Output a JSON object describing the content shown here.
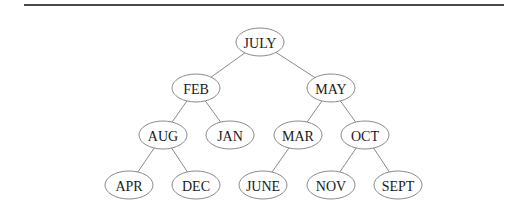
{
  "diagram": {
    "type": "binary-search-tree",
    "nodes": [
      {
        "id": "JULY",
        "label": "JULY",
        "cx": 260,
        "cy": 42
      },
      {
        "id": "FEB",
        "label": "FEB",
        "cx": 196,
        "cy": 88
      },
      {
        "id": "MAY",
        "label": "MAY",
        "cx": 331,
        "cy": 88
      },
      {
        "id": "AUG",
        "label": "AUG",
        "cx": 163,
        "cy": 135
      },
      {
        "id": "JAN",
        "label": "JAN",
        "cx": 230,
        "cy": 135
      },
      {
        "id": "MAR",
        "label": "MAR",
        "cx": 298,
        "cy": 135
      },
      {
        "id": "OCT",
        "label": "OCT",
        "cx": 365,
        "cy": 135
      },
      {
        "id": "APR",
        "label": "APR",
        "cx": 129,
        "cy": 185
      },
      {
        "id": "DEC",
        "label": "DEC",
        "cx": 196,
        "cy": 185
      },
      {
        "id": "JUNE",
        "label": "JUNE",
        "cx": 263,
        "cy": 185
      },
      {
        "id": "NOV",
        "label": "NOV",
        "cx": 331,
        "cy": 185
      },
      {
        "id": "SEPT",
        "label": "SEPT",
        "cx": 398,
        "cy": 185
      }
    ],
    "edges": [
      {
        "from": "JULY",
        "to": "FEB"
      },
      {
        "from": "JULY",
        "to": "MAY"
      },
      {
        "from": "FEB",
        "to": "AUG"
      },
      {
        "from": "FEB",
        "to": "JAN"
      },
      {
        "from": "MAY",
        "to": "MAR"
      },
      {
        "from": "MAY",
        "to": "OCT"
      },
      {
        "from": "AUG",
        "to": "APR"
      },
      {
        "from": "AUG",
        "to": "DEC"
      },
      {
        "from": "MAR",
        "to": "JUNE"
      },
      {
        "from": "OCT",
        "to": "NOV"
      },
      {
        "from": "OCT",
        "to": "SEPT"
      }
    ],
    "style": {
      "node_rx": 24,
      "node_ry": 14,
      "stroke_color": "#8a8a8a",
      "text_color": "#1a1a1a",
      "rule_color": "#4a4a4a"
    }
  }
}
